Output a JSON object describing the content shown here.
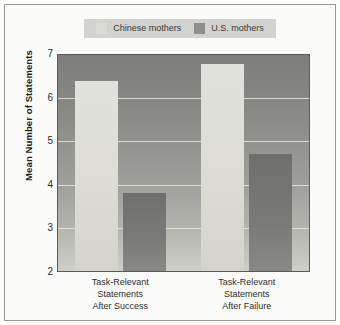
{
  "chart_data": {
    "type": "bar",
    "title": "",
    "xlabel": "",
    "ylabel": "Mean Number of Statements",
    "ylim": [
      2,
      7
    ],
    "yticks": [
      7,
      6,
      5,
      4,
      3,
      2
    ],
    "grid": true,
    "legend_position": "top-center",
    "categories": [
      "Task-Relevant Statements After Success",
      "Task-Relevant Statements After Failure"
    ],
    "category_lines": [
      [
        "Task-Relevant",
        "Statements",
        "After Success"
      ],
      [
        "Task-Relevant",
        "Statements",
        "After Failure"
      ]
    ],
    "series": [
      {
        "name": "Chinese mothers",
        "color": "#dcdcd6",
        "values": [
          6.4,
          6.8
        ]
      },
      {
        "name": "U.S. mothers",
        "color": "#8e8e8c",
        "values": [
          3.8,
          4.7
        ]
      }
    ]
  },
  "legend": {
    "entries": [
      {
        "label": "Chinese mothers",
        "swatch": "chinese-swatch"
      },
      {
        "label": "U.S. mothers",
        "swatch": "us-swatch"
      }
    ]
  },
  "axes": {
    "y_title": "Mean Number of Statements",
    "y_ticks": [
      "7",
      "6",
      "5",
      "4",
      "3",
      "2"
    ]
  },
  "colors": {
    "chinese_bar": "#dcdcd6",
    "us_bar": "#8e8e8c",
    "plot_bg_top": "#7d7d7b",
    "plot_bg_bottom": "#cfcfc9",
    "gridline": "#e8e8e2",
    "frame": "#9a9a96",
    "legend_bg": "#d2d2cf"
  }
}
